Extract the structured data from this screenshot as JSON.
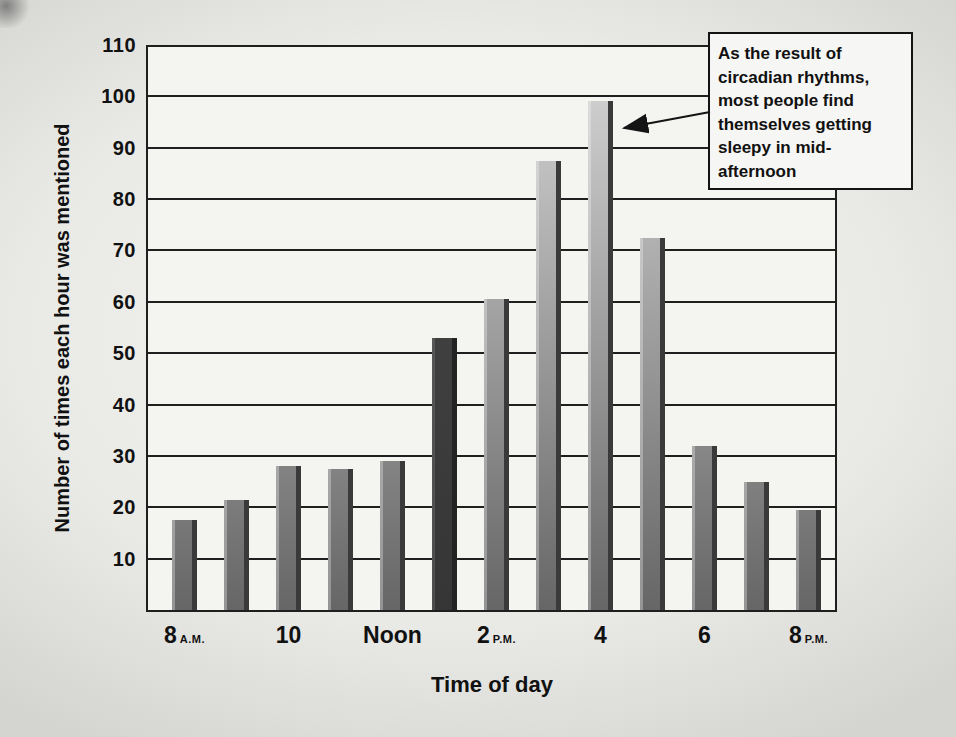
{
  "colors": {
    "line": "#1f1f1f",
    "plot_background": "#f4f4f1",
    "page_background": "#e9e9e6",
    "bar_gradient_top": "#d8d8d8",
    "bar_gradient_bottom": "#666666",
    "bar_shadow_edge": "#3a3a3a",
    "highlighted_bar": "#414141",
    "annotation_background": "#f6f6f4",
    "text": "#111111"
  },
  "chart_data": {
    "type": "bar",
    "title": "",
    "xlabel": "Time of day",
    "ylabel": "Number of times each hour was mentioned",
    "ylim": [
      0,
      110
    ],
    "yticks": [
      110,
      100,
      90,
      80,
      70,
      60,
      50,
      40,
      30,
      20,
      10
    ],
    "grid": "horizontal",
    "legend": "none",
    "categories": [
      "8 A.M.",
      "9",
      "10",
      "11",
      "Noon",
      "1",
      "2 P.M.",
      "3",
      "4",
      "5",
      "6",
      "7",
      "8 P.M."
    ],
    "values": [
      17.5,
      21.5,
      28,
      27.5,
      29,
      53,
      60.5,
      87.5,
      99,
      72.5,
      32,
      25,
      19.5
    ],
    "highlighted_bar_index": 5,
    "x_axis_labels": [
      {
        "text": "8",
        "suffix": "A.M.",
        "bar_index": 0
      },
      {
        "text": "10",
        "suffix": "",
        "bar_index": 2
      },
      {
        "text": "Noon",
        "suffix": "",
        "bar_index": 4
      },
      {
        "text": "2",
        "suffix": "P.M.",
        "bar_index": 6
      },
      {
        "text": "4",
        "suffix": "",
        "bar_index": 8
      },
      {
        "text": "6",
        "suffix": "",
        "bar_index": 10
      },
      {
        "text": "8",
        "suffix": "P.M.",
        "bar_index": 12
      }
    ],
    "annotation": {
      "lines": [
        "As the result of",
        "circadian rhythms,",
        "most people find",
        "themselves getting",
        "sleepy in mid-",
        "afternoon"
      ],
      "points_to_category": "4",
      "points_to_value": 99
    }
  }
}
